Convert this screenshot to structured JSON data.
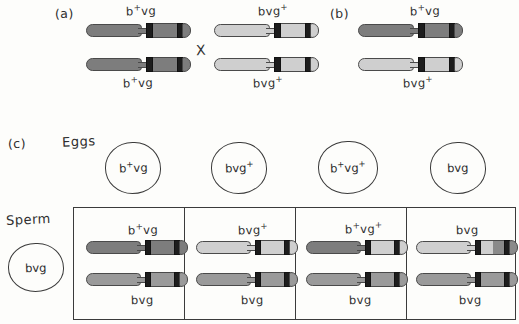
{
  "figure": {
    "title_absent": true,
    "panels": [
      {
        "id": "a",
        "label": "(a)",
        "cross_symbol": "X",
        "parents": [
          {
            "position": "left",
            "top_label_top": "b+ vg",
            "top_label_bottom": "b+ vg",
            "shade": "dark"
          },
          {
            "position": "right",
            "top_label_top": "b vg+",
            "top_label_bottom": "b vg+",
            "shade": "light"
          }
        ]
      },
      {
        "id": "b",
        "label": "(b)",
        "offspring": {
          "top_label": "b+ vg",
          "bottom_label": "b vg+",
          "top_shade": "dark",
          "bottom_shade": "light"
        }
      },
      {
        "id": "c",
        "label": "(c)",
        "eggs_label": "Eggs",
        "sperm_label": "Sperm",
        "eggs": [
          {
            "genotype_parts": [
              "b",
              "+",
              " vg"
            ],
            "text": "b+ vg"
          },
          {
            "genotype_parts": [
              "b",
              "",
              " vg",
              "+"
            ],
            "text": "b vg+"
          },
          {
            "genotype_parts": [
              "b",
              "+",
              " vg",
              "+"
            ],
            "text": "b+ vg+"
          },
          {
            "genotype_parts": [
              "b",
              "",
              " vg"
            ],
            "text": "b vg"
          }
        ],
        "sperm": {
          "text": "b vg"
        },
        "offspring_boxes": [
          {
            "top_label": "b+ vg",
            "bottom_label": "b vg",
            "top_shade": "dark",
            "bottom_shade": "medium"
          },
          {
            "top_label": "b vg+",
            "bottom_label": "b vg",
            "top_shade": "light",
            "bottom_shade": "medium"
          },
          {
            "top_label": "b+ vg+",
            "bottom_label": "b vg",
            "top_shade": "recombinant-dark-light",
            "bottom_shade": "medium"
          },
          {
            "top_label": "b vg",
            "bottom_label": "b vg",
            "top_shade": "recombinant-light-dark",
            "bottom_shade": "medium"
          }
        ]
      }
    ]
  },
  "colors": {
    "background": "#fdfdfb",
    "ink": "#2e2e2e",
    "chromosome_dark": "#7d7d7d",
    "chromosome_medium": "#9a9a9a",
    "chromosome_light": "#cfcfcf",
    "band_black": "#1d1d1d",
    "outline": "#4a4a4a"
  }
}
